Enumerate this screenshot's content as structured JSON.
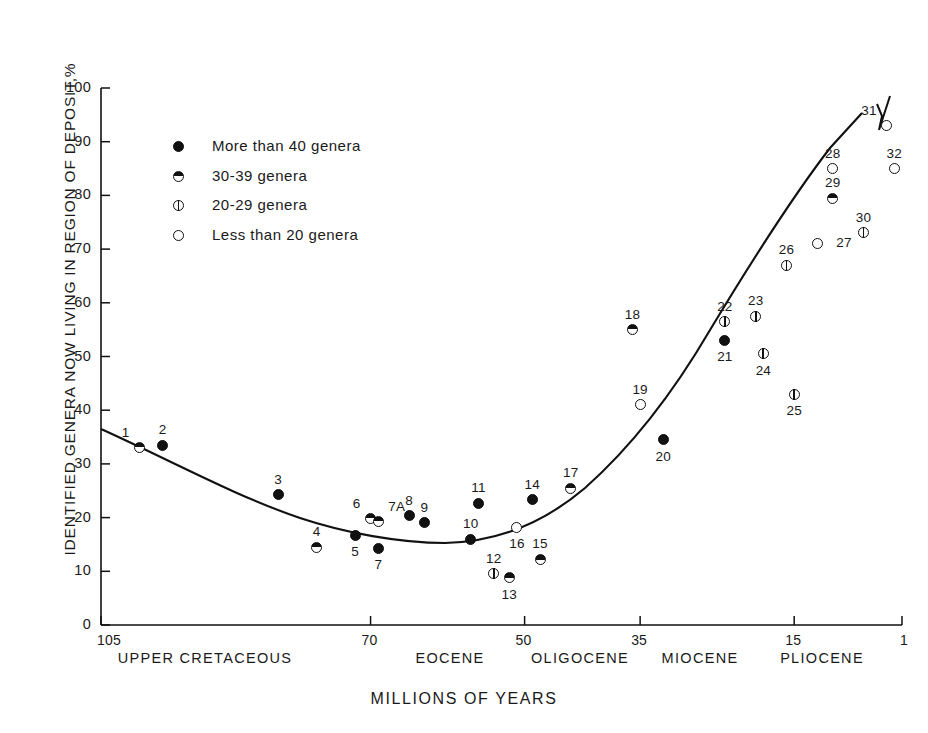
{
  "chart_data": {
    "type": "scatter",
    "title": "",
    "xlabel": "MILLIONS OF YEARS",
    "ylabel": "IDENTIFIED GENERA NOW LIVING IN REGION OF DEPOSIT,%",
    "ylim": [
      0,
      100
    ],
    "yticks": [
      0,
      10,
      20,
      30,
      40,
      50,
      60,
      70,
      80,
      90,
      100
    ],
    "xticks": [
      "105",
      "70",
      "50",
      "35",
      "15",
      "1"
    ],
    "xtick_values": [
      105,
      70,
      50,
      35,
      15,
      1
    ],
    "x_axis_inverted": true,
    "grid": false,
    "legend_position": "upper-left",
    "epochs": [
      "UPPER CRETACEOUS",
      "EOCENE",
      "OLIGOCENE",
      "MIOCENE",
      "PLIOCENE"
    ],
    "legend": [
      {
        "marker": "filled-circle",
        "label": "More than 40 genera"
      },
      {
        "marker": "half-filled-circle",
        "label": "30-39 genera"
      },
      {
        "marker": "bar-circle",
        "label": "20-29 genera"
      },
      {
        "marker": "open-circle",
        "label": "Less than 20 genera"
      }
    ],
    "series": [
      {
        "name": "More than 40 genera",
        "marker": "filled-circle"
      },
      {
        "name": "30-39 genera",
        "marker": "half-filled-circle"
      },
      {
        "name": "20-29 genera",
        "marker": "bar-circle"
      },
      {
        "name": "Less than 20 genera",
        "marker": "open-circle"
      }
    ],
    "points": [
      {
        "id": "1",
        "x": 100,
        "y": 33,
        "marker": "half-filled-circle",
        "label_pos": "above-left"
      },
      {
        "id": "2",
        "x": 97,
        "y": 33.5,
        "marker": "filled-circle",
        "label_pos": "above"
      },
      {
        "id": "3",
        "x": 82,
        "y": 24.3,
        "marker": "filled-circle",
        "label_pos": "above"
      },
      {
        "id": "4",
        "x": 77,
        "y": 14.5,
        "marker": "half-filled-circle",
        "label_pos": "above"
      },
      {
        "id": "5",
        "x": 72,
        "y": 16.7,
        "marker": "filled-circle",
        "label_pos": "below"
      },
      {
        "id": "6",
        "x": 70,
        "y": 19.8,
        "marker": "half-filled-circle",
        "label_pos": "above-left"
      },
      {
        "id": "7A",
        "x": 69,
        "y": 19.2,
        "marker": "half-filled-circle",
        "label_pos": "above-right"
      },
      {
        "id": "7",
        "x": 69,
        "y": 14.3,
        "marker": "filled-circle",
        "label_pos": "below"
      },
      {
        "id": "8",
        "x": 65,
        "y": 20.3,
        "marker": "filled-circle",
        "label_pos": "above"
      },
      {
        "id": "9",
        "x": 63,
        "y": 19,
        "marker": "filled-circle",
        "label_pos": "above"
      },
      {
        "id": "10",
        "x": 57,
        "y": 16,
        "marker": "filled-circle",
        "label_pos": "above"
      },
      {
        "id": "11",
        "x": 56,
        "y": 22.7,
        "marker": "filled-circle",
        "label_pos": "above"
      },
      {
        "id": "12",
        "x": 54,
        "y": 9.5,
        "marker": "bar-circle",
        "label_pos": "above"
      },
      {
        "id": "13",
        "x": 52,
        "y": 8.8,
        "marker": "half-filled-circle",
        "label_pos": "below"
      },
      {
        "id": "14",
        "x": 49,
        "y": 23.3,
        "marker": "filled-circle",
        "label_pos": "above"
      },
      {
        "id": "15",
        "x": 48,
        "y": 12.2,
        "marker": "half-filled-circle",
        "label_pos": "above"
      },
      {
        "id": "16",
        "x": 51,
        "y": 18.2,
        "marker": "open-circle",
        "label_pos": "below"
      },
      {
        "id": "17",
        "x": 44,
        "y": 25.5,
        "marker": "half-filled-circle",
        "label_pos": "above"
      },
      {
        "id": "18",
        "x": 36,
        "y": 55,
        "marker": "half-filled-circle",
        "label_pos": "above"
      },
      {
        "id": "19",
        "x": 35,
        "y": 41,
        "marker": "open-circle",
        "label_pos": "above"
      },
      {
        "id": "20",
        "x": 32,
        "y": 34.5,
        "marker": "filled-circle",
        "label_pos": "below"
      },
      {
        "id": "21",
        "x": 24,
        "y": 53,
        "marker": "filled-circle",
        "label_pos": "below"
      },
      {
        "id": "22",
        "x": 24,
        "y": 56.5,
        "marker": "bar-circle",
        "label_pos": "above"
      },
      {
        "id": "23",
        "x": 20,
        "y": 57.5,
        "marker": "bar-circle",
        "label_pos": "above"
      },
      {
        "id": "24",
        "x": 19,
        "y": 50.5,
        "marker": "bar-circle",
        "label_pos": "below"
      },
      {
        "id": "25",
        "x": 15,
        "y": 43,
        "marker": "bar-circle",
        "label_pos": "below"
      },
      {
        "id": "26",
        "x": 16,
        "y": 67,
        "marker": "bar-circle",
        "label_pos": "above"
      },
      {
        "id": "27",
        "x": 12,
        "y": 71,
        "marker": "open-circle",
        "label_pos": "right"
      },
      {
        "id": "28",
        "x": 10,
        "y": 85,
        "marker": "open-circle",
        "label_pos": "above"
      },
      {
        "id": "29",
        "x": 10,
        "y": 79.5,
        "marker": "half-filled-circle",
        "label_pos": "above"
      },
      {
        "id": "30",
        "x": 6,
        "y": 73,
        "marker": "bar-circle",
        "label_pos": "above"
      },
      {
        "id": "31",
        "x": 3,
        "y": 93,
        "marker": "open-circle",
        "label_pos": "above-left"
      },
      {
        "id": "32",
        "x": 2,
        "y": 85,
        "marker": "open-circle",
        "label_pos": "above"
      }
    ],
    "fitted_curve_note": "smooth U-shaped trend curve through the data, minimum near 16% around 57 Ma, rising to ~93% near 1 Ma"
  }
}
